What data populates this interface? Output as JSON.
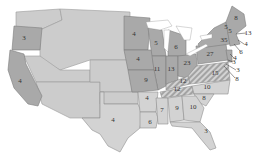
{
  "map": {
    "subject": "United States electoral votes by state (1860-era election map)",
    "colors": {
      "dark_states": "#a9a9a9",
      "light_states": "#d3d3d3",
      "territories": "#cccccc",
      "hatched_states": "#bdbdbd"
    },
    "labels": [
      {
        "id": "oregon",
        "value": "3",
        "x": 24,
        "y": 38
      },
      {
        "id": "california",
        "value": "4",
        "x": 20,
        "y": 81
      },
      {
        "id": "minnesota",
        "value": "4",
        "x": 134,
        "y": 34
      },
      {
        "id": "wisconsin",
        "value": "5",
        "x": 156,
        "y": 43
      },
      {
        "id": "michigan",
        "value": "6",
        "x": 176,
        "y": 47
      },
      {
        "id": "iowa",
        "value": "4",
        "x": 138,
        "y": 59
      },
      {
        "id": "illinois",
        "value": "11",
        "x": 157,
        "y": 69
      },
      {
        "id": "indiana",
        "value": "13",
        "x": 171,
        "y": 69
      },
      {
        "id": "ohio",
        "value": "23",
        "x": 187,
        "y": 63
      },
      {
        "id": "pennsylvania",
        "value": "27",
        "x": 210,
        "y": 54
      },
      {
        "id": "new-york",
        "value": "35",
        "x": 224,
        "y": 40
      },
      {
        "id": "maine",
        "value": "8",
        "x": 236,
        "y": 18
      },
      {
        "id": "vermont",
        "value": "5",
        "x": 226,
        "y": 27
      },
      {
        "id": "new-hampshire",
        "value": "5",
        "x": 230,
        "y": 31
      },
      {
        "id": "massachusetts",
        "value": "13",
        "x": 248,
        "y": 33
      },
      {
        "id": "rhode-island",
        "value": "4",
        "x": 246,
        "y": 44
      },
      {
        "id": "connecticut",
        "value": "6",
        "x": 241,
        "y": 52
      },
      {
        "id": "new-jersey",
        "value": "4",
        "x": 235,
        "y": 58
      },
      {
        "id": "delaware",
        "value": "3",
        "x": 234,
        "y": 62
      },
      {
        "id": "maryland",
        "value": "3",
        "x": 238,
        "y": 70
      },
      {
        "id": "delaware-md-2",
        "value": "8",
        "x": 237,
        "y": 79
      },
      {
        "id": "missouri",
        "value": "9",
        "x": 146,
        "y": 80
      },
      {
        "id": "virginia",
        "value": "15",
        "x": 215,
        "y": 73
      },
      {
        "id": "kentucky",
        "value": "12",
        "x": 183,
        "y": 81
      },
      {
        "id": "tennessee",
        "value": "12",
        "x": 177,
        "y": 89
      },
      {
        "id": "north-carolina",
        "value": "10",
        "x": 207,
        "y": 87
      },
      {
        "id": "south-carolina",
        "value": "8",
        "x": 204,
        "y": 98
      },
      {
        "id": "arkansas",
        "value": "4",
        "x": 147,
        "y": 98
      },
      {
        "id": "mississippi",
        "value": "7",
        "x": 162,
        "y": 110
      },
      {
        "id": "alabama",
        "value": "9",
        "x": 177,
        "y": 108
      },
      {
        "id": "georgia",
        "value": "10",
        "x": 193,
        "y": 107
      },
      {
        "id": "louisiana",
        "value": "6",
        "x": 150,
        "y": 122
      },
      {
        "id": "texas",
        "value": "4",
        "x": 113,
        "y": 120
      },
      {
        "id": "florida",
        "value": "3",
        "x": 206,
        "y": 131
      }
    ]
  }
}
